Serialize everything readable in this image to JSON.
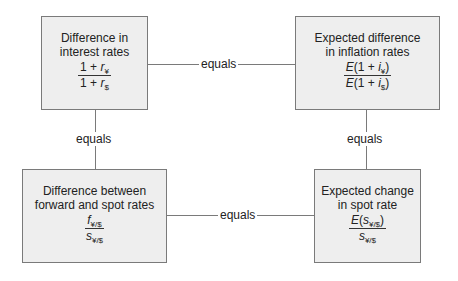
{
  "diagram": {
    "boxes": {
      "interest": {
        "title_line1": "Difference in",
        "title_line2": "interest rates",
        "num_prefix": "1 + ",
        "num_var": "r",
        "num_sub": "¥",
        "den_prefix": "1 + ",
        "den_var": "r",
        "den_sub": "$"
      },
      "inflation": {
        "title_line1": "Expected difference",
        "title_line2": "in inflation rates",
        "num_E": "E",
        "num_mid": "(1 + ",
        "num_var": "i",
        "num_sub": "¥",
        "num_close": ")",
        "den_E": "E",
        "den_mid": "(1 + ",
        "den_var": "i",
        "den_sub": "$",
        "den_close": ")"
      },
      "forward_spot": {
        "title_line1": "Difference between",
        "title_line2": "forward and spot rates",
        "num_var": "f",
        "num_sub": "¥/$",
        "den_var": "s",
        "den_sub": "¥/$"
      },
      "spot_change": {
        "title_line1": "Expected change",
        "title_line2": "in spot rate",
        "num_E": "E",
        "num_open": "(",
        "num_var": "s",
        "num_sub": "¥/$",
        "num_close": ")",
        "den_var": "s",
        "den_sub": "¥/$"
      }
    },
    "connectors": {
      "top": "equals",
      "bottom": "equals",
      "left": "equals",
      "right": "equals"
    }
  }
}
